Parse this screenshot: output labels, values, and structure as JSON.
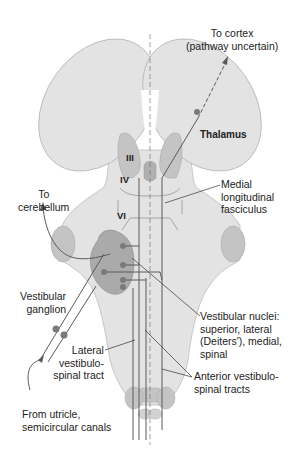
{
  "labels": {
    "to_cortex": [
      "To cortex",
      "(pathway uncertain)"
    ],
    "thalamus": "Thalamus",
    "nucleus_iii": "III",
    "nucleus_iv": "IV",
    "nucleus_vi": "VI",
    "mlf": [
      "Medial",
      "longitudinal",
      "fasciculus"
    ],
    "to_cerebellum": [
      "To",
      "cerebellum"
    ],
    "vestibular_ganglion": [
      "Vestibular",
      "ganglion"
    ],
    "vestibular_nuclei": [
      "Vestibular nuclei:",
      "superior, lateral",
      "(Deiters'), medial,",
      "spinal"
    ],
    "lateral_vst": [
      "Lateral",
      "vestibulo-",
      "spinal tract"
    ],
    "anterior_vst": [
      "Anterior vestibulo-",
      "spinal tracts"
    ],
    "from_utricle": [
      "From utricle,",
      "semicircular canals"
    ]
  },
  "colors": {
    "tissue": "#e3e3e3",
    "tissue_outline": "#b5b5b5",
    "nuclei": "#bdbdbd",
    "dark_nuclei": "#a8a8a8",
    "pathway": "#5a5a5a",
    "dot": "#7a7a7a"
  }
}
